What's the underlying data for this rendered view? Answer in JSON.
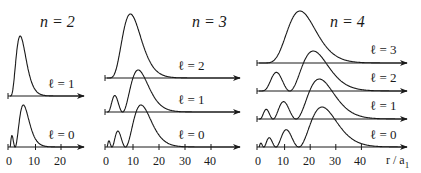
{
  "chart_data": {
    "type": "line",
    "xlabel": "r / a1",
    "ylabel": "",
    "grid": false,
    "panels": [
      {
        "title": "n = 2",
        "n": 2,
        "xlim": [
          0,
          28
        ],
        "xticks": [
          0,
          10,
          20
        ],
        "series": [
          {
            "name": "ℓ = 1",
            "l": 1,
            "nodes": 0,
            "peak_r": 4
          },
          {
            "name": "ℓ = 0",
            "l": 0,
            "nodes": 1,
            "node_r": [
              2
            ],
            "peak_r": 5.2
          }
        ]
      },
      {
        "title": "n = 3",
        "n": 3,
        "xlim": [
          0,
          50
        ],
        "xticks": [
          0,
          10,
          20,
          30,
          40
        ],
        "series": [
          {
            "name": "ℓ = 2",
            "l": 2,
            "nodes": 0,
            "peak_r": 9
          },
          {
            "name": "ℓ = 1",
            "l": 1,
            "nodes": 1,
            "node_r": [
              6
            ],
            "peak_r": 12
          },
          {
            "name": "ℓ = 0",
            "l": 0,
            "nodes": 2,
            "node_r": [
              1.9,
              7.1
            ],
            "peak_r": 13.1
          }
        ]
      },
      {
        "title": "n = 4",
        "n": 4,
        "xlim": [
          0,
          58
        ],
        "xticks": [
          0,
          10,
          20,
          30,
          40
        ],
        "series": [
          {
            "name": "ℓ = 3",
            "l": 3,
            "nodes": 0,
            "peak_r": 16
          },
          {
            "name": "ℓ = 2",
            "l": 2,
            "nodes": 1,
            "node_r": [
              12
            ],
            "peak_r": 21
          },
          {
            "name": "ℓ = 1",
            "l": 1,
            "nodes": 2,
            "node_r": [
              5.5,
              16
            ],
            "peak_r": 24
          },
          {
            "name": "ℓ = 0",
            "l": 0,
            "nodes": 3,
            "node_r": [
              1.9,
              6.6,
              15.3
            ],
            "peak_r": 25
          }
        ]
      }
    ]
  },
  "labels": {
    "n2": "n = 2",
    "n3": "n = 3",
    "n4": "n = 4",
    "l0": "ℓ = 0",
    "l1": "ℓ = 1",
    "l2": "ℓ = 2",
    "l3": "ℓ = 3",
    "xaxis": "r / a",
    "xaxis_sub": "1",
    "t0": "0",
    "t10": "10",
    "t20": "20",
    "t30": "30",
    "t40": "40"
  },
  "colors": {
    "line": "#1a1a1a",
    "background": "#ffffff"
  }
}
